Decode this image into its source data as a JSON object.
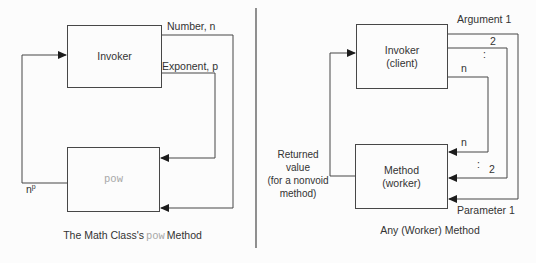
{
  "colors": {
    "line": "#474747",
    "text": "#333333",
    "code": "#a8a8a8",
    "bg": "#fcfcfc"
  },
  "figure": {
    "left": {
      "invoker_box": "Invoker",
      "worker_box": "pow",
      "input_top_label": "Number, n",
      "input_bottom_label": "Exponent, p",
      "return_base": "n",
      "return_exponent": "p",
      "caption": {
        "prefix": "The Math Class's",
        "code": "pow",
        "suffix": "Method"
      }
    },
    "right": {
      "invoker_line1": "Invoker",
      "invoker_line2": "(client)",
      "worker_line1": "Method",
      "worker_line2": "(worker)",
      "arg1": "Argument 1",
      "arg2": "2",
      "dots_top": ":",
      "argn": "n",
      "paramn": "n",
      "dots_bottom": ":",
      "param2": "2",
      "param1": "Parameter 1",
      "return_lines": [
        "Returned",
        "value",
        "(for a nonvoid",
        "method)"
      ],
      "caption": "Any (Worker) Method"
    }
  }
}
